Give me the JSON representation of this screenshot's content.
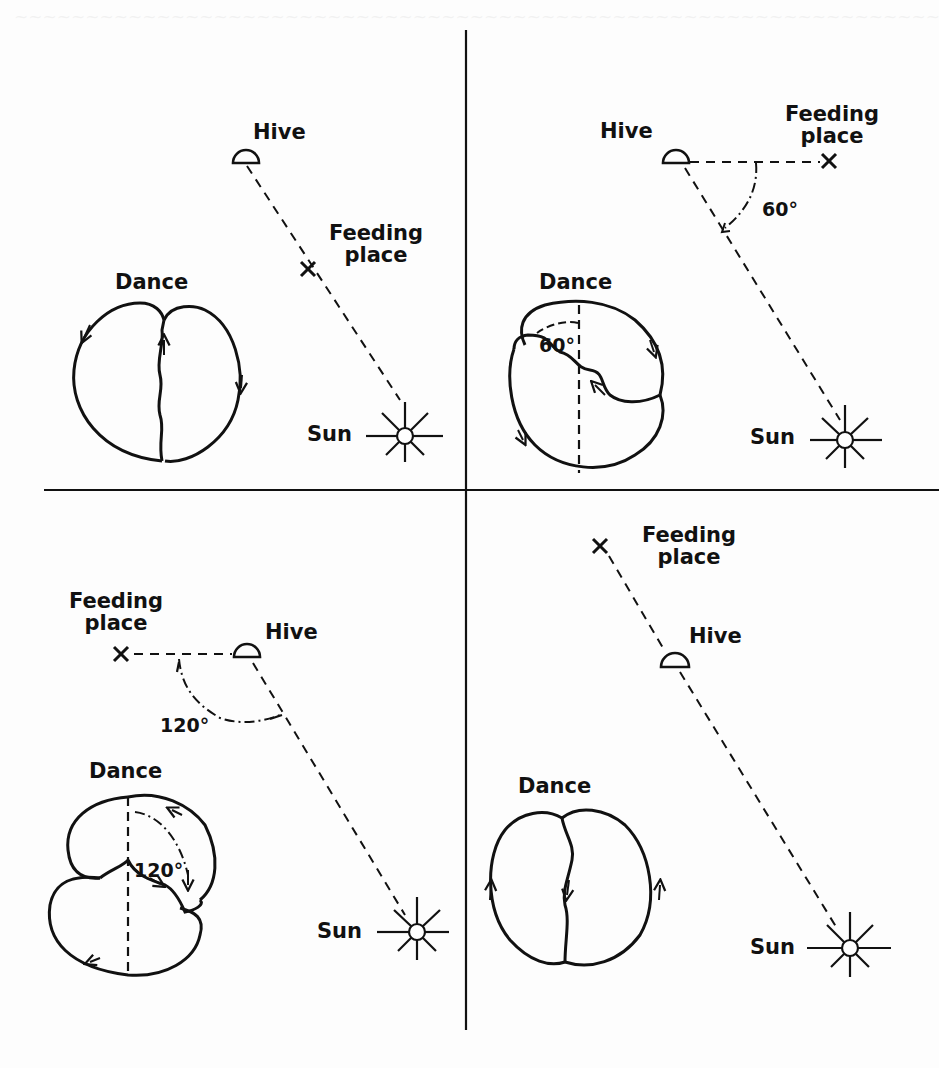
{
  "figure": {
    "stroke_color": "#111111",
    "background_color": "#fdfdfd",
    "panels": [
      {
        "id": "top-left",
        "hive_label": "Hive",
        "feeding_label_line1": "Feeding",
        "feeding_label_line2": "place",
        "dance_label": "Dance",
        "sun_label": "Sun",
        "angle_label": "",
        "waggle_direction": "straight up"
      },
      {
        "id": "top-right",
        "hive_label": "Hive",
        "feeding_label_line1": "Feeding",
        "feeding_label_line2": "place",
        "dance_label": "Dance",
        "sun_label": "Sun",
        "angle_label": "60°",
        "dance_angle_label": "60°",
        "waggle_direction": "60° left of vertical"
      },
      {
        "id": "bottom-left",
        "hive_label": "Hive",
        "feeding_label_line1": "Feeding",
        "feeding_label_line2": "place",
        "dance_label": "Dance",
        "sun_label": "Sun",
        "angle_label": "120°",
        "dance_angle_label": "120°",
        "waggle_direction": "120° right of vertical"
      },
      {
        "id": "bottom-right",
        "hive_label": "Hive",
        "feeding_label_line1": "Feeding",
        "feeding_label_line2": "place",
        "dance_label": "Dance",
        "sun_label": "Sun",
        "angle_label": "",
        "waggle_direction": "straight down"
      }
    ]
  }
}
